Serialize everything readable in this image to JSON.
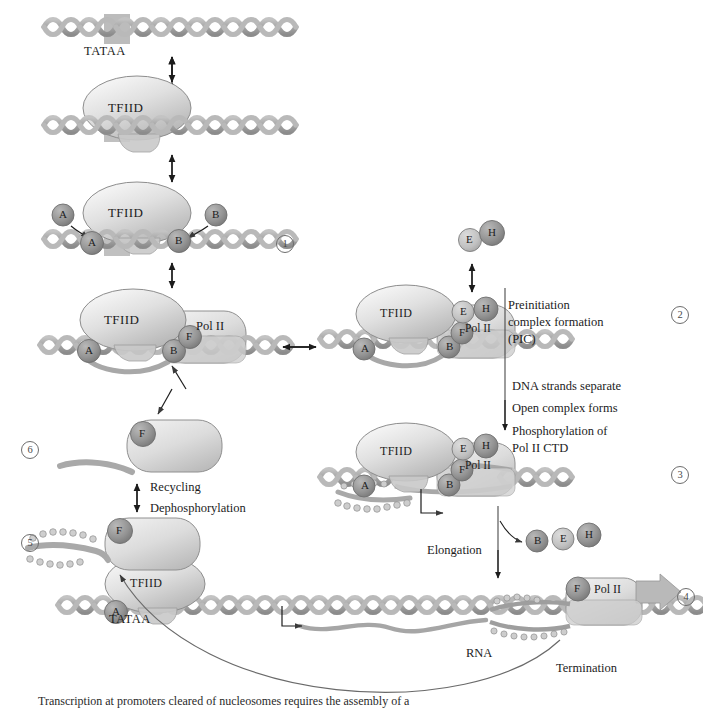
{
  "figure": {
    "caption": "Transcription at promoters cleared of nucleosomes requires the assembly of a",
    "promoter_label": "TATAA",
    "polymerase_label": "Pol II",
    "tfiid_label": "TFIID",
    "rna_label": "RNA"
  },
  "factors": {
    "a": "A",
    "b": "B",
    "e": "E",
    "f": "F",
    "h": "H"
  },
  "steps": [
    {
      "id": "1",
      "number": "1"
    },
    {
      "id": "2",
      "number": "2"
    },
    {
      "id": "3",
      "number": "3"
    },
    {
      "id": "4",
      "number": "4"
    },
    {
      "id": "5",
      "number": "5"
    },
    {
      "id": "6",
      "number": "6"
    }
  ],
  "annotations": {
    "pic_line1": "Preinitiation",
    "pic_line2": "complex formation",
    "pic_line3": "(PIC)",
    "strands_separate": "DNA strands separate",
    "open_complex": "Open complex forms",
    "phosphorylation_line1": "Phosphorylation of",
    "phosphorylation_line2": "Pol II CTD",
    "elongation": "Elongation",
    "termination": "Termination",
    "recycling": "Recycling",
    "dephosphorylation": "Dephosphorylation"
  },
  "colors": {
    "dna": "#a9a9a9",
    "dna_dark": "#8e8e8e",
    "protein_light": "#d4d4d4",
    "protein_mid": "#b5b5b5",
    "factor_dark": "#8a8a8a",
    "factor_light": "#c2c2c2",
    "ink": "#1c1c1c",
    "line": "#5a5a5a",
    "tata_box": "#b0b0b0"
  }
}
